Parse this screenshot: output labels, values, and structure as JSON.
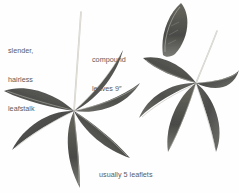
{
  "figure": {
    "kind": "botanical-illustration",
    "background_color": "#fefefe",
    "ink_color": "#5b5b5b",
    "leaf_dark": "#4a4a48",
    "leaf_mid": "#6e6e6b",
    "leaf_light": "#9a9a96",
    "stalk_color": "#cfcdc6"
  },
  "annotations": {
    "leafstalk": {
      "line1": "slender,",
      "line2": "hairless",
      "line3": "leafstalk"
    },
    "compound": {
      "line1": "compound",
      "line2": "leaves 9″"
    },
    "leaflets": {
      "line1": "usually 5 leaflets",
      "line2": "(sometimes 7), each 5″"
    }
  },
  "specimens": [
    {
      "name": "left-compound-leaf",
      "hub": [
        74,
        111
      ],
      "stalk_tip": [
        81,
        12
      ],
      "leaflet_count": 5
    },
    {
      "name": "right-compound-leaf",
      "hub": [
        196,
        83
      ],
      "stalk_tip": [
        217,
        31
      ],
      "leaflet_count": 5
    },
    {
      "name": "detached-leaflet",
      "hub": [
        180,
        30
      ],
      "leaflet_count": 1
    }
  ]
}
